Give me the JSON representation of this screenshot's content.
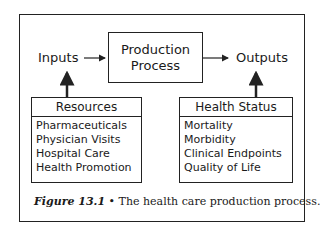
{
  "diagram": {
    "inputs_label": "Inputs",
    "outputs_label": "Outputs",
    "process": {
      "line1": "Production",
      "line2": "Process"
    },
    "resources": {
      "title": "Resources",
      "items": [
        "Pharmaceuticals",
        "Physician Visits",
        "Hospital Care",
        "Health Promotion"
      ]
    },
    "health_status": {
      "title": "Health Status",
      "items": [
        "Mortality",
        "Morbidity",
        "Clinical Endpoints",
        "Quality of Life"
      ]
    }
  },
  "caption": {
    "figure_label": "Figure 13.1",
    "bullet": "•",
    "text": "The health care production process."
  }
}
